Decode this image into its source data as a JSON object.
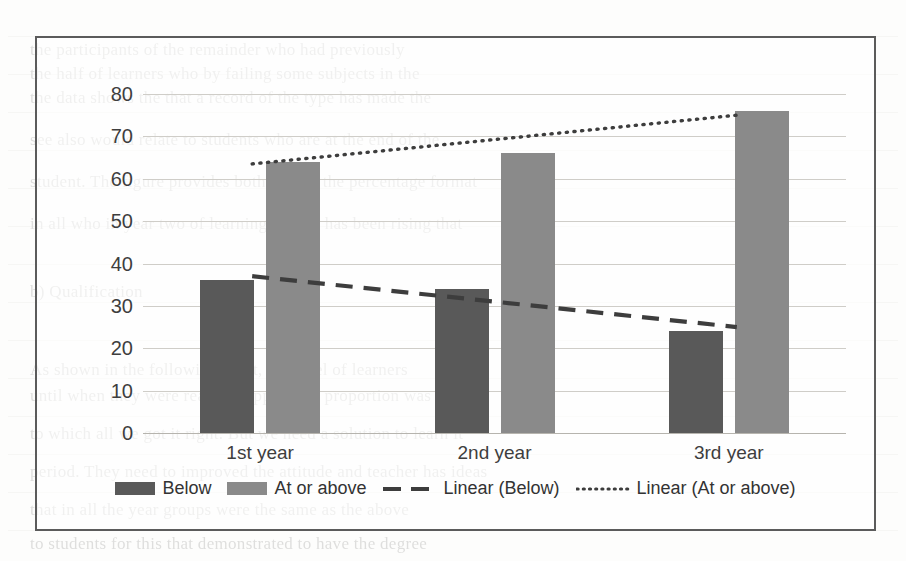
{
  "figure": {
    "kind": "grouped-bar-chart-with-trendlines",
    "border_color": "#5b5b5b",
    "background": "#ffffff"
  },
  "chart_data": {
    "type": "bar",
    "title": "",
    "subtitle": "",
    "xlabel": "",
    "ylabel": "",
    "categories": [
      "1st year",
      "2nd year",
      "3rd year"
    ],
    "series": [
      {
        "name": "Below",
        "values": [
          36,
          34,
          24
        ],
        "color": "#595959",
        "style": "bar"
      },
      {
        "name": "At or above",
        "values": [
          64,
          66,
          76
        ],
        "color": "#8a8a8a",
        "style": "bar"
      }
    ],
    "trendlines": [
      {
        "name": "Linear (Below)",
        "style": "dashed",
        "color": "#3d3d3d",
        "start_value": 37,
        "end_value": 25
      },
      {
        "name": "Linear (At or above)",
        "style": "dotted",
        "color": "#3d3d3d",
        "start_value": 63.5,
        "end_value": 75
      }
    ],
    "ylim": [
      0,
      80
    ],
    "ytick_step": 10,
    "yticks": [
      "80",
      "70",
      "60",
      "50",
      "40",
      "30",
      "20",
      "10",
      "0"
    ],
    "grid": true,
    "grid_axis": "y",
    "legend_position": "bottom",
    "legend": [
      {
        "label": "Below",
        "marker": "filled-rect",
        "color": "#595959"
      },
      {
        "label": "At or above",
        "marker": "filled-rect",
        "color": "#8a8a8a"
      },
      {
        "label": "Linear (Below)",
        "marker": "dashed-line",
        "color": "#3d3d3d"
      },
      {
        "label": "Linear (At or above)",
        "marker": "dotted-line",
        "color": "#3d3d3d"
      }
    ]
  },
  "page_showthrough": {
    "note": "faint text from the underlying printed page visible behind the figure",
    "lines": [
      {
        "text": "the participants of the remainder who had previously",
        "x": 30,
        "y": 40
      },
      {
        "text": "the half of learners who by failing some subjects in the",
        "x": 30,
        "y": 64
      },
      {
        "text": "the data shows the that a record of the type has made the",
        "x": 30,
        "y": 88
      },
      {
        "text": "see also would relate to students who are at the end of the",
        "x": 30,
        "y": 130
      },
      {
        "text": "student. The figure provides both data in the percentage format",
        "x": 30,
        "y": 172
      },
      {
        "text": "in all who in year two of learning further has been rising that",
        "x": 30,
        "y": 214
      },
      {
        "text": "b) Qualification",
        "x": 30,
        "y": 282
      },
      {
        "text": "As shown in the following chart, the level of learners",
        "x": 30,
        "y": 360
      },
      {
        "text": "until when they were ready to apply. The proportion was",
        "x": 30,
        "y": 386
      },
      {
        "text": "to which all we got it right. But we need a solution to learn it",
        "x": 30,
        "y": 424
      },
      {
        "text": "period. They need to improved the attitude and teacher has ideas",
        "x": 30,
        "y": 462
      },
      {
        "text": "that in all the year groups were the same as the above",
        "x": 30,
        "y": 500
      },
      {
        "text": "to students for this that demonstrated to have the degree",
        "x": 30,
        "y": 534
      }
    ]
  }
}
